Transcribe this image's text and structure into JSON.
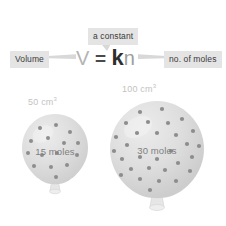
{
  "diagram": {
    "background_color": "#ffffff"
  },
  "equation": {
    "v_symbol": "V",
    "equals": "=",
    "k_symbol": "k",
    "n_symbol": "n",
    "full_text": "V = kn",
    "v_color": "#b4b4b4",
    "equals_color": "#4a4a4a",
    "k_color": "#2e2e2e",
    "n_color": "#9d9d9d"
  },
  "callouts": {
    "constant": {
      "label": "a constant",
      "background": "#e4e4e4",
      "text_color": "#3a3a3a",
      "points_to": "k"
    },
    "volume": {
      "label": "Volume",
      "background": "#e4e4e4",
      "text_color": "#3a3a3a",
      "points_to": "V"
    },
    "moles": {
      "label": "no. of moles",
      "background": "#e4e4e4",
      "text_color": "#3a3a3a",
      "points_to": "n"
    }
  },
  "balloons": [
    {
      "id": "small",
      "volume_value": "50",
      "volume_unit": "cm",
      "volume_exponent": "3",
      "volume_caption": "50 cm³",
      "moles_label": "15 moles",
      "dot_count": 15,
      "body_color": "#dcdcdc",
      "dot_color": "#8d8d8d",
      "caption_color": "#c2c2c2",
      "moles_text_color": "#7f7f7f"
    },
    {
      "id": "large",
      "volume_value": "100",
      "volume_unit": "cm",
      "volume_exponent": "3",
      "volume_caption": "100 cm³",
      "moles_label": "30 moles",
      "dot_count": 30,
      "body_color": "#dcdcdc",
      "dot_color": "#8d8d8d",
      "caption_color": "#c2c2c2",
      "moles_text_color": "#7f7f7f"
    }
  ]
}
